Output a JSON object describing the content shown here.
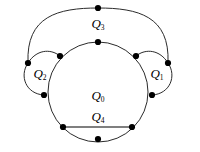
{
  "figure": {
    "background_color": "#ffffff",
    "stroke_color": "#2b2b2b",
    "vertex_color": "#000000",
    "labels": {
      "q0": {
        "base": "Q",
        "sub": "0",
        "x": 98,
        "y": 96
      },
      "q1": {
        "base": "Q",
        "sub": "1",
        "x": 157,
        "y": 75
      },
      "q2": {
        "base": "Q",
        "sub": "2",
        "x": 39,
        "y": 75
      },
      "q3": {
        "base": "Q",
        "sub": "3",
        "x": 98,
        "y": 24
      },
      "q4": {
        "base": "Q",
        "sub": "4",
        "x": 98,
        "y": 117
      }
    },
    "vertices": [
      {
        "name": "vertex-top-outer",
        "x": 98,
        "y": 8
      },
      {
        "name": "vertex-top-inner",
        "x": 98,
        "y": 42
      },
      {
        "name": "vertex-left-outer",
        "x": 28,
        "y": 63
      },
      {
        "name": "vertex-right-outer",
        "x": 168,
        "y": 63
      },
      {
        "name": "vertex-upper-left-inner",
        "x": 60,
        "y": 56
      },
      {
        "name": "vertex-upper-right-inner",
        "x": 136,
        "y": 56
      },
      {
        "name": "vertex-lower-left-inner",
        "x": 44,
        "y": 95
      },
      {
        "name": "vertex-lower-right-inner",
        "x": 152,
        "y": 95
      },
      {
        "name": "vertex-chord-left",
        "x": 63,
        "y": 127
      },
      {
        "name": "vertex-chord-right",
        "x": 132,
        "y": 127
      },
      {
        "name": "vertex-bottom",
        "x": 98,
        "y": 139
      }
    ],
    "edges": {
      "main_circle": {
        "cx": 98,
        "cy": 92,
        "r": 50
      },
      "chord_q4": {
        "x1": 63,
        "y1": 127,
        "x2": 132,
        "y2": 127
      },
      "outer_arc_top": "M 28 63 C 28 14 58 8 98 8 C 138 8 168 14 168 63",
      "left_lobe_outer": "M 28 63 C 20 82 28 97 44 95",
      "left_lobe_inner": "M 28 63 C 44 56 60 43 60 56",
      "right_lobe_outer": "M 168 63 C 176 82 168 97 152 95",
      "right_lobe_inner": "M 168 63 C 152 56 136 43 136 56"
    },
    "vertex_radius": 3.1,
    "stroke_width": 1.0
  }
}
